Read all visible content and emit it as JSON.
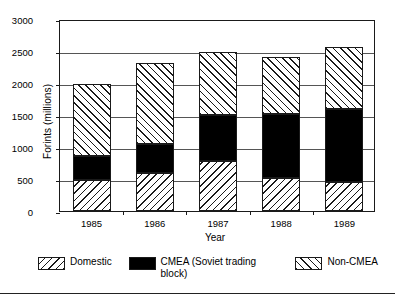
{
  "chart_data": {
    "type": "bar",
    "stacked": true,
    "title": "",
    "xlabel": "Year",
    "ylabel": "Forints (millions)",
    "categories": [
      "1985",
      "1986",
      "1987",
      "1988",
      "1989"
    ],
    "ylim": [
      0,
      3000
    ],
    "yticks": [
      0,
      500,
      1000,
      1500,
      2000,
      2500,
      3000
    ],
    "ytick_labels": [
      "0",
      "500",
      "1000",
      "1500",
      "2000",
      "2500",
      "3000"
    ],
    "grid": true,
    "legend_position": "bottom",
    "series": [
      {
        "name": "Domestic",
        "pattern": "backward-hatch",
        "color": "#ffffff",
        "values": [
          480,
          600,
          780,
          510,
          450
        ]
      },
      {
        "name": "CMEA (Soviet trading block)",
        "pattern": "solid",
        "color": "#000000",
        "values": [
          375,
          440,
          720,
          1010,
          1150
        ]
      },
      {
        "name": "Non-CMEA",
        "pattern": "forward-hatch",
        "color": "#ffffff",
        "values": [
          1135,
          1280,
          990,
          885,
          970
        ]
      }
    ],
    "totals": [
      1990,
      2320,
      2490,
      2405,
      2570
    ]
  },
  "legend": {
    "entries": [
      {
        "label": "Domestic"
      },
      {
        "label": "CMEA (Soviet trading block)"
      },
      {
        "label": "Non-CMEA"
      }
    ]
  }
}
